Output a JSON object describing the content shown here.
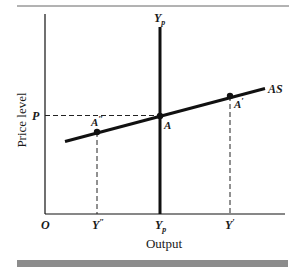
{
  "diagram": {
    "type": "economics-supply-diagram",
    "y_axis_label": "Price level",
    "x_axis_label": "Output",
    "origin_label": "O",
    "price_label": "P",
    "curve_label": "AS",
    "vertical_line_label": "Y",
    "vertical_line_subscript": "p",
    "points": [
      {
        "name": "A''",
        "label": "A",
        "prime": "″"
      },
      {
        "name": "A",
        "label": "A",
        "prime": ""
      },
      {
        "name": "A'",
        "label": "A",
        "prime": "′"
      }
    ],
    "x_ticks": [
      {
        "label": "Y",
        "suffix": "″",
        "sub": ""
      },
      {
        "label": "Y",
        "suffix": "",
        "sub": "p"
      },
      {
        "label": "Y",
        "suffix": "′",
        "sub": ""
      }
    ],
    "colors": {
      "line": "#111111",
      "bar": "#8c8c8c",
      "rule": "#555555"
    }
  }
}
